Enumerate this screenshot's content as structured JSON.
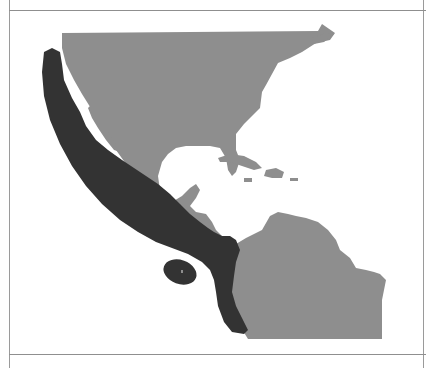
{
  "header": {
    "title": ""
  },
  "map": {
    "region": "North, Central and South America (Pacific coast)",
    "colors": {
      "land": "#8e8e8e",
      "range": "#333333",
      "water": "#ffffff",
      "frame": "#9a9a9a"
    },
    "layers": [
      {
        "name": "land",
        "label": ""
      },
      {
        "name": "species-range",
        "label": ""
      },
      {
        "name": "island-range",
        "label": ""
      }
    ]
  },
  "footer": {
    "caption": ""
  }
}
